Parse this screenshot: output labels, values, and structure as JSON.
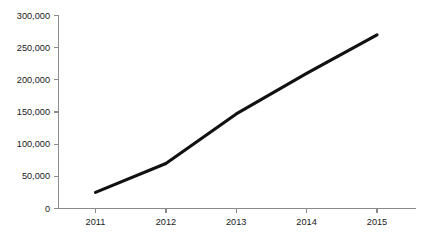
{
  "chart_data": {
    "type": "line",
    "title": "",
    "subtitle": "",
    "xlabel": "",
    "ylabel": "",
    "categories": [
      "2011",
      "2012",
      "2013",
      "2014",
      "2015"
    ],
    "x": [
      2011,
      2012,
      2013,
      2014,
      2015
    ],
    "values": [
      25000,
      70000,
      147000,
      210000,
      270000
    ],
    "series": [
      {
        "name": "",
        "values": [
          25000,
          70000,
          147000,
          210000,
          270000
        ]
      }
    ],
    "ylim": [
      0,
      300000
    ],
    "xlim": [
      2011,
      2015
    ],
    "y_ticks": [
      0,
      50000,
      100000,
      150000,
      200000,
      250000,
      300000
    ],
    "y_tick_labels": [
      "0",
      "50,000",
      "100,000",
      "150,000",
      "200,000",
      "250,000",
      "300,000"
    ],
    "x_ticks": [
      2011,
      2012,
      2013,
      2014,
      2015
    ],
    "x_tick_labels": [
      "2011",
      "2012",
      "2013",
      "2014",
      "2015"
    ],
    "grid": false,
    "legend": false,
    "legend_position": "none",
    "annotations": [],
    "colors": {
      "line": "#111111",
      "axis": "#8a8a8a",
      "background": "#ffffff",
      "tick_label": "#1a1a1a"
    }
  }
}
